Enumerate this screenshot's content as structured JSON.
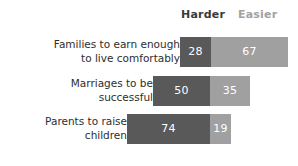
{
  "legend": {
    "harder": "Harder",
    "easier": "Easier"
  },
  "colors": {
    "harder_bar": "#595959",
    "easier_bar": "#a0a0a0",
    "harder_label": "#3a3a3a",
    "easier_label": "#a2a2a2",
    "value_text": "#ffffff",
    "category_text": "#2e2e2e",
    "background": "#ffffff"
  },
  "rows": [
    {
      "label": "Families to earn enough\nto live comfortably",
      "harder": "28",
      "easier": "67",
      "harder_px": 31,
      "easier_px": 77
    },
    {
      "label": "Marriages to be\nsuccessful",
      "harder": "50",
      "easier": "35",
      "harder_px": 57,
      "easier_px": 40
    },
    {
      "label": "Parents to raise\nchildren",
      "harder": "74",
      "easier": "19",
      "harder_px": 83,
      "easier_px": 21
    }
  ],
  "chart_data": {
    "type": "bar",
    "title": "",
    "subtitle": "",
    "xlabel": "",
    "ylabel": "",
    "orientation": "horizontal",
    "stacked": true,
    "diverging": true,
    "grid": false,
    "legend_position": "top",
    "categories": [
      "Families to earn enough to live comfortably",
      "Marriages to be successful",
      "Parents to raise children"
    ],
    "series": [
      {
        "name": "Harder",
        "values": [
          28,
          50,
          74
        ],
        "color": "#595959"
      },
      {
        "name": "Easier",
        "values": [
          67,
          35,
          19
        ],
        "color": "#a0a0a0"
      }
    ],
    "value_unit": "percent",
    "xlim": [
      0,
      100
    ]
  }
}
